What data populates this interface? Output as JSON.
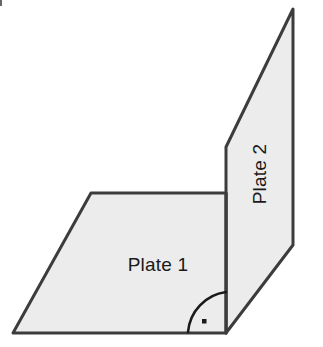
{
  "figure": {
    "background_color": "#ffffff",
    "stroke_color": "#3c3c3c",
    "fill_color": "#ececec",
    "label_color": "#1a1a1a",
    "stroke_width": 3,
    "labels": {
      "plate1": "Plate 1",
      "plate2": "Plate 2"
    },
    "angle_marker": {
      "name": "right-angle-marker",
      "symbol": "·",
      "value": "90",
      "unit": "degrees",
      "description": "right angle between Plate 1 and Plate 2"
    },
    "shapes": {
      "plate1_points": "91,193 226,193 226,333 13,333",
      "plate2_points": "226,147 293,9 293,245 226,333",
      "fold_line": {
        "x1": 226,
        "y1": 193,
        "x2": 226,
        "y2": 333
      }
    }
  }
}
